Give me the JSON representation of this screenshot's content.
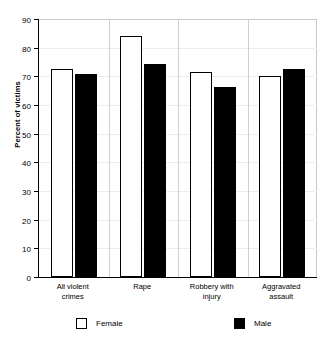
{
  "chart_data": {
    "type": "bar",
    "title": "",
    "subtitle": "",
    "xlabel": "",
    "ylabel": "Percent of victims",
    "ylim": [
      0,
      90
    ],
    "yticks": [
      0,
      10,
      20,
      30,
      40,
      50,
      60,
      70,
      80,
      90
    ],
    "ytick_labels": [
      "0",
      "10",
      "20",
      "30",
      "40",
      "50",
      "60",
      "70",
      "80",
      "90"
    ],
    "grid": false,
    "legend_position": "bottom",
    "categories": [
      "All violent\ncrimes",
      "Rape",
      "Robbery with\ninjury",
      "Aggravated\nassault"
    ],
    "series": [
      {
        "name": "Female",
        "color": "#ffffff",
        "edge_color": "#000000",
        "values": [
          72.5,
          84,
          71.5,
          70
        ]
      },
      {
        "name": "Male",
        "color": "#000000",
        "edge_color": "#000000",
        "values": [
          70.8,
          74.3,
          66.3,
          72.7
        ]
      }
    ]
  },
  "legend": {
    "items": [
      {
        "label": "Female",
        "swatch": "white-square-icon"
      },
      {
        "label": "Male",
        "swatch": "black-square-icon"
      }
    ]
  },
  "axes": {
    "y_title": "Percent of victims"
  }
}
